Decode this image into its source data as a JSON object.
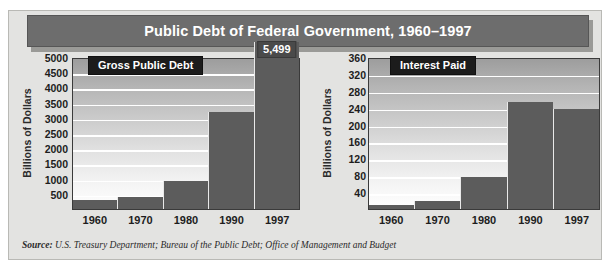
{
  "title": "Public Debt of Federal Government, 1960–1997",
  "source_prefix": "Source:",
  "source_text": " U.S. Treasury Department; Bureau of the Public Debt; Office of Management and  Budget",
  "colors": {
    "title_bar": "#6d6d6d",
    "panel": "#e3e3e1",
    "bar": "#5c5c5c",
    "legend_box": "#1c1c1c",
    "callout": "#4a4a4a",
    "gridline": "#ffffff"
  },
  "chart_data": [
    {
      "type": "bar",
      "id": "gross-public-debt",
      "title": "Gross Public Debt",
      "xlabel": "",
      "ylabel": "Billions of Dollars",
      "categories": [
        "1960",
        "1970",
        "1980",
        "1990",
        "1997"
      ],
      "values": [
        290,
        381,
        909,
        3207,
        5499
      ],
      "ylim": [
        0,
        5000
      ],
      "yticks": [
        5000,
        4500,
        4000,
        3500,
        3000,
        2500,
        2000,
        1500,
        1000,
        500
      ],
      "grid": true,
      "legend_position": "top-inside",
      "annotations": [
        {
          "category": "1997",
          "label": "5,499",
          "note": "bar extends above axis maximum"
        }
      ]
    },
    {
      "type": "bar",
      "id": "interest-paid",
      "title": "Interest Paid",
      "xlabel": "",
      "ylabel": "Billions of Dollars",
      "categories": [
        "1960",
        "1970",
        "1980",
        "1990",
        "1997"
      ],
      "values": [
        9,
        19,
        75,
        254,
        238
      ],
      "ylim": [
        0,
        360
      ],
      "yticks": [
        360,
        320,
        280,
        240,
        200,
        160,
        120,
        80,
        40
      ],
      "grid": true,
      "legend_position": "top-inside",
      "annotations": []
    }
  ]
}
